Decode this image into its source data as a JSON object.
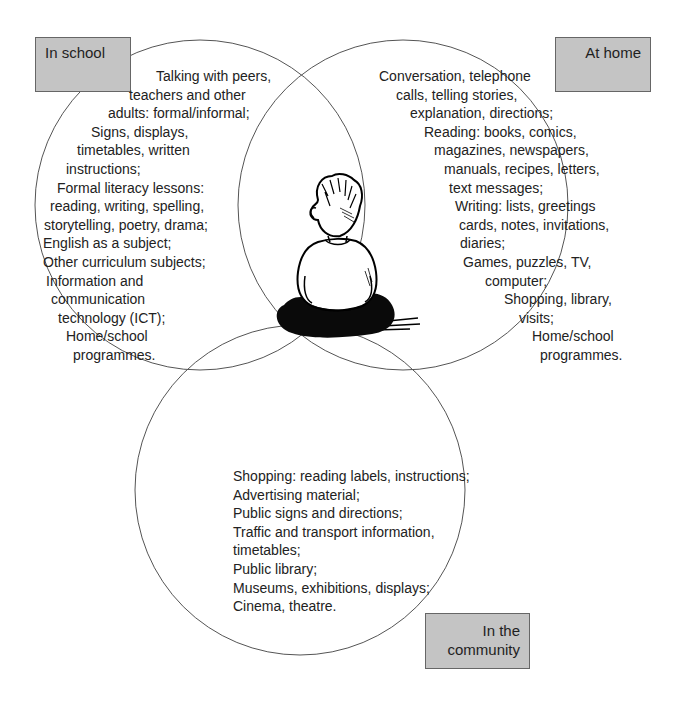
{
  "diagram": {
    "type": "venn",
    "circles": [
      {
        "id": "school",
        "cx": 200,
        "cy": 205,
        "r": 165
      },
      {
        "id": "home",
        "cx": 403,
        "cy": 205,
        "r": 165
      },
      {
        "id": "community",
        "cx": 300,
        "cy": 490,
        "r": 165
      }
    ],
    "colors": {
      "stroke": "#555555",
      "label_fill": "#c4c4c4",
      "label_border": "#666666",
      "text": "#222222"
    },
    "center_illustration": "child-sitting-cross-legged-back-view"
  },
  "labels": {
    "school": "In school",
    "home": "At home",
    "community_line1": "In the",
    "community_line2": "community"
  },
  "school": {
    "lines": [
      {
        "text": "Talking with peers,",
        "x": 156
      },
      {
        "text": "teachers and other",
        "x": 129
      },
      {
        "text": "adults: formal/informal;",
        "x": 108
      },
      {
        "text": "Signs, displays,",
        "x": 91
      },
      {
        "text": "timetables, written",
        "x": 77
      },
      {
        "text": "instructions;",
        "x": 66
      },
      {
        "text": "Formal literacy lessons:",
        "x": 57
      },
      {
        "text": "reading, writing, spelling,",
        "x": 50
      },
      {
        "text": "storytelling, poetry, drama;",
        "x": 44
      },
      {
        "text": "English as a subject;",
        "x": 43
      },
      {
        "text": "Other curriculum subjects;",
        "x": 43
      },
      {
        "text": "Information and",
        "x": 46
      },
      {
        "text": "communication",
        "x": 51
      },
      {
        "text": "technology (ICT);",
        "x": 58
      },
      {
        "text": "Home/school",
        "x": 66
      },
      {
        "text": "programmes.",
        "x": 73
      }
    ]
  },
  "home": {
    "lines": [
      {
        "text": "Conversation, telephone",
        "x": 1
      },
      {
        "text": "calls, telling stories,",
        "x": 18
      },
      {
        "text": "explanation, directions;",
        "x": 32
      },
      {
        "text": "Reading: books, comics,",
        "x": 46
      },
      {
        "text": "magazines, newspapers,",
        "x": 56
      },
      {
        "text": "manuals, recipes, letters,",
        "x": 66
      },
      {
        "text": "text messages;",
        "x": 71
      },
      {
        "text": "Writing: lists, greetings",
        "x": 77
      },
      {
        "text": "cards, notes, invitations,",
        "x": 81
      },
      {
        "text": "diaries;",
        "x": 82
      },
      {
        "text": "Games, puzzles, TV,",
        "x": 85
      },
      {
        "text": "computer;",
        "x": 107
      },
      {
        "text": "Shopping, library,",
        "x": 126
      },
      {
        "text": "visits;",
        "x": 141
      },
      {
        "text": "Home/school",
        "x": 154
      },
      {
        "text": "programmes.",
        "x": 162
      }
    ]
  },
  "community": {
    "lines": [
      "Shopping: reading labels, instructions;",
      "Advertising material;",
      "Public signs and directions;",
      "Traffic and transport information,",
      "timetables;",
      "Public library;",
      "Museums, exhibitions, displays;",
      "Cinema, theatre."
    ]
  }
}
